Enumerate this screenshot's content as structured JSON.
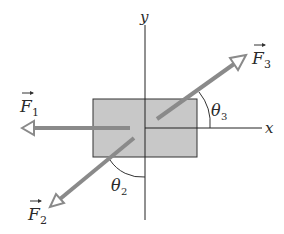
{
  "diagram": {
    "axes": {
      "x_label": "x",
      "y_label": "y"
    },
    "block": {
      "fill": "#c8c8c8",
      "stroke": "#333333"
    },
    "forces": [
      {
        "id": "F1",
        "label": "F",
        "subscript": "1",
        "direction": "negative x"
      },
      {
        "id": "F2",
        "label": "F",
        "subscript": "2",
        "direction": "down-left"
      },
      {
        "id": "F3",
        "label": "F",
        "subscript": "3",
        "direction": "up-right"
      }
    ],
    "angles": [
      {
        "id": "theta2",
        "label": "θ",
        "subscript": "2",
        "between": "F2 and negative y axis"
      },
      {
        "id": "theta3",
        "label": "θ",
        "subscript": "3",
        "between": "F3 and positive x axis"
      }
    ],
    "colors": {
      "arrow": "#8a8a8a",
      "axis": "#222222",
      "text": "#2a2a2a"
    }
  }
}
